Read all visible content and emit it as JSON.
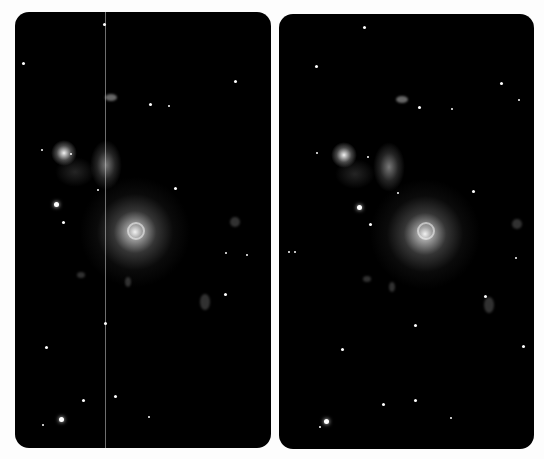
{
  "image": {
    "description": "Two side-by-side astronomical deep-field images of a galaxy field with a bright central galaxy and a nebulous clump; left panel shows a vertical artifact line",
    "background": "#fdfdfd",
    "panel_color": "#000000"
  },
  "panels": [
    {
      "id": "left",
      "label": "",
      "has_artifact_line": true
    },
    {
      "id": "right",
      "label": "",
      "has_artifact_line": false
    }
  ]
}
